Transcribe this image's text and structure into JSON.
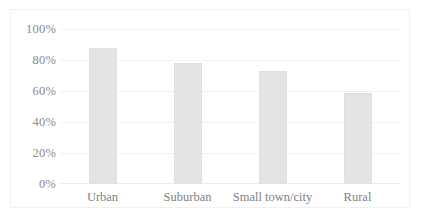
{
  "chart_data": {
    "type": "bar",
    "title": "",
    "subtitle": "",
    "xlabel": "",
    "ylabel": "",
    "categories": [
      "Urban",
      "Suburban",
      "Small town/city",
      "Rural"
    ],
    "values": [
      88,
      78,
      73,
      59
    ],
    "series": [
      {
        "name": "",
        "values": [
          88,
          78,
          73,
          59
        ]
      }
    ],
    "ylim": [
      0,
      100
    ],
    "y_ticks": [
      0,
      20,
      40,
      60,
      80,
      100
    ],
    "y_tick_labels": [
      "0%",
      "20%",
      "40%",
      "60%",
      "80%",
      "100%"
    ],
    "grid": "horizontal",
    "legend": "none",
    "bar_color": "#e4e4e4",
    "gridline_color": "#f2f2f2",
    "tick_label_color": "#8a8a8a",
    "category_label_color": "#7f7f7f",
    "border_color": "#f1f1f1",
    "background_color": "#ffffff",
    "annotations": []
  }
}
